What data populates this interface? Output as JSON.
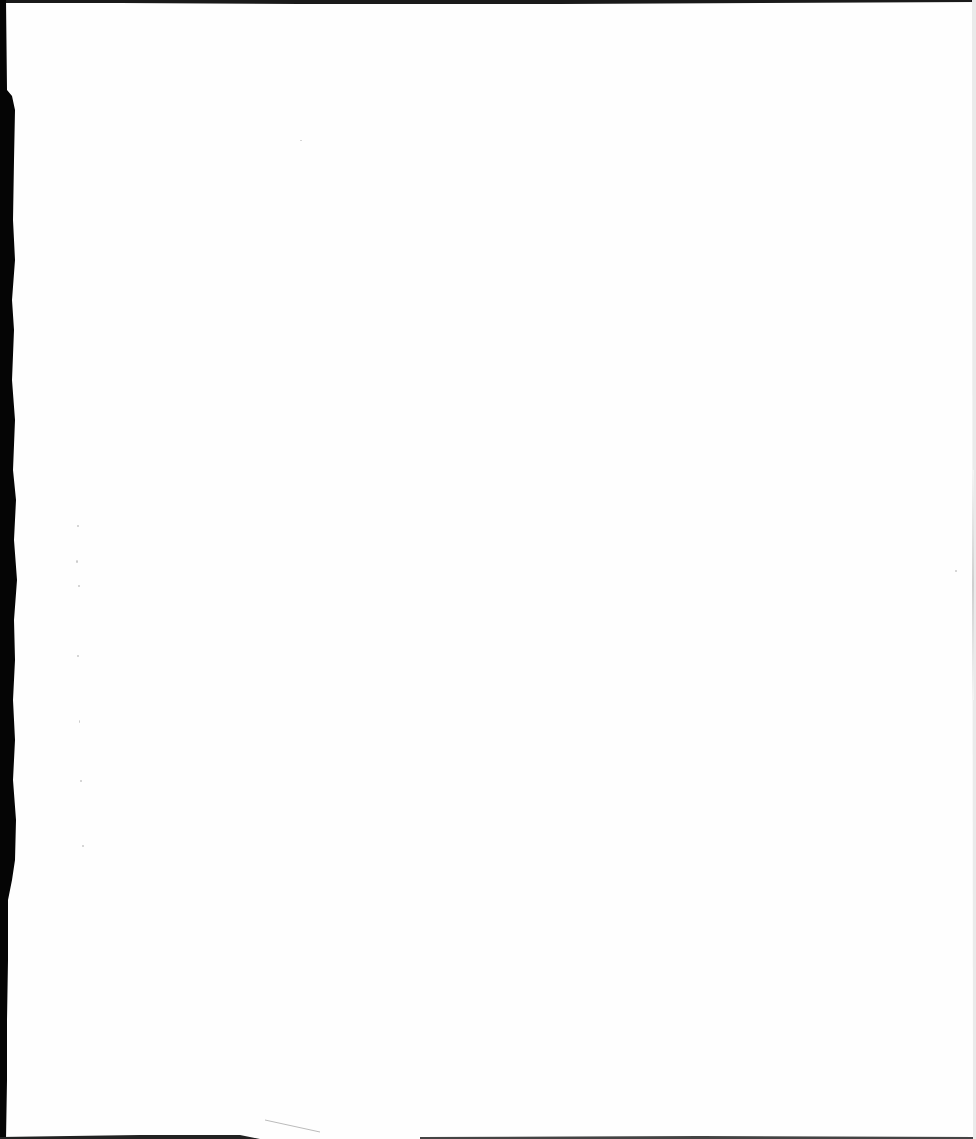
{
  "document": {
    "type": "scanned-page",
    "content": "",
    "state": "blank"
  },
  "colors": {
    "paper": "#fefefe",
    "scan_edge": "#000000",
    "bleed_through": "#c9c9c9"
  }
}
